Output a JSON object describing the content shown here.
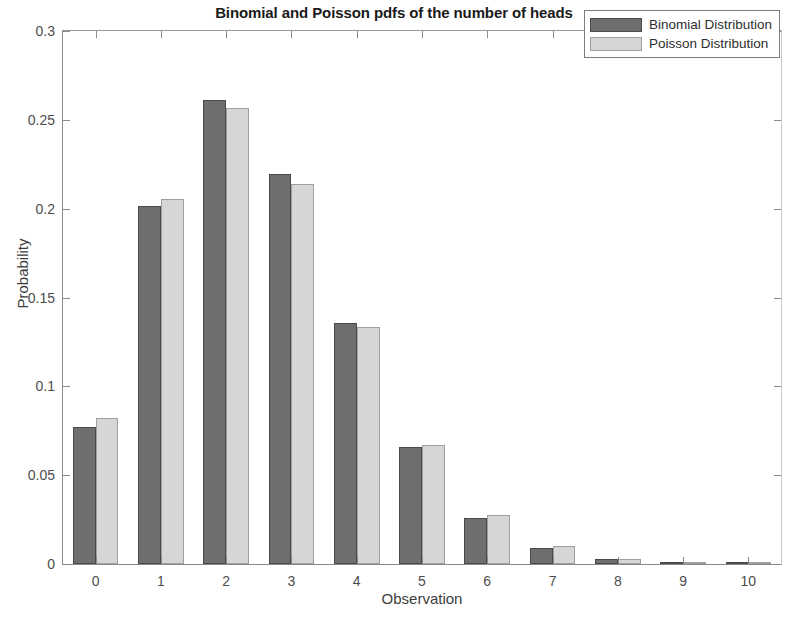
{
  "chart_data": {
    "type": "bar",
    "title": "Binomial and Poisson pdfs of the number of heads",
    "xlabel": "Observation",
    "ylabel": "Probability",
    "categories": [
      "0",
      "1",
      "2",
      "3",
      "4",
      "5",
      "6",
      "7",
      "8",
      "9",
      "10"
    ],
    "series": [
      {
        "name": "Binomial Distribution",
        "color": "#6e6e6e",
        "values": [
          0.0769,
          0.2013,
          0.2611,
          0.2194,
          0.1359,
          0.066,
          0.0257,
          0.0088,
          0.0026,
          0.0006,
          0.0001
        ]
      },
      {
        "name": "Poisson Distribution",
        "color": "#d6d6d6",
        "values": [
          0.0821,
          0.2052,
          0.2565,
          0.2138,
          0.1336,
          0.0668,
          0.0278,
          0.0099,
          0.0031,
          0.0009,
          0.0002
        ]
      }
    ],
    "ylim": [
      0,
      0.3
    ],
    "yticks": [
      0,
      0.05,
      0.1,
      0.15,
      0.2,
      0.25,
      0.3
    ],
    "ytick_labels": [
      "0",
      "0.05",
      "0.1",
      "0.15",
      "0.2",
      "0.25",
      "0.3"
    ],
    "xlim": [
      -0.5,
      10.5
    ],
    "xticks": [
      0,
      1,
      2,
      3,
      4,
      5,
      6,
      7,
      8,
      9,
      10
    ],
    "grid": false,
    "legend_position": "top-right"
  },
  "legend": {
    "entries": [
      {
        "label": "Binomial Distribution"
      },
      {
        "label": "Poisson Distribution"
      }
    ]
  }
}
